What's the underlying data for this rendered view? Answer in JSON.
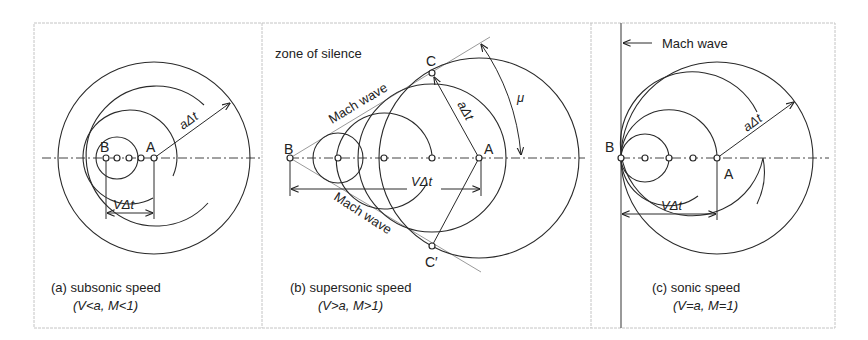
{
  "figure": {
    "panels": [
      {
        "id": "a",
        "caption_line1": "(a) subsonic speed",
        "caption_line2": "(V<a, M<1)",
        "points": {
          "B": "B",
          "A": "A"
        },
        "labels": {
          "radius": "aΔt",
          "displacement": "VΔt"
        }
      },
      {
        "id": "b",
        "caption_line1": "(b) supersonic speed",
        "caption_line2": "(V>a, M>1)",
        "points": {
          "B": "B",
          "A": "A",
          "C": "C",
          "C_prime": "C′"
        },
        "labels": {
          "zone": "zone of silence",
          "mach_wave_top": "Mach wave",
          "mach_wave_bottom": "Mach wave",
          "radius": "aΔt",
          "displacement": "VΔt",
          "angle": "μ"
        }
      },
      {
        "id": "c",
        "caption_line1": "(c) sonic speed",
        "caption_line2": "(V=a, M=1)",
        "points": {
          "B": "B",
          "A": "A"
        },
        "labels": {
          "mach_wave": "Mach wave",
          "radius": "aΔt",
          "displacement": "VΔt"
        }
      }
    ]
  },
  "colors": {
    "line": "#2a2a2a",
    "mach_line": "#9a9a9a",
    "border": "#c4c4c4",
    "background": "#ffffff"
  }
}
